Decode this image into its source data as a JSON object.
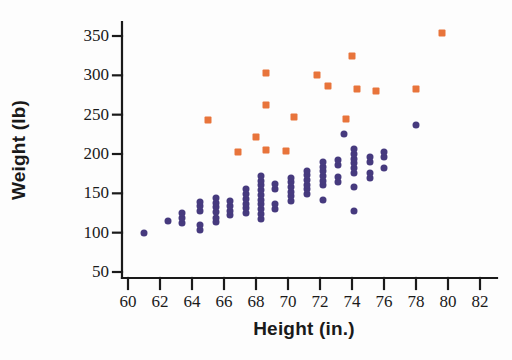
{
  "chart_data": {
    "type": "scatter",
    "title": "",
    "xlabel": "Height (in.)",
    "ylabel": "Weight (lb)",
    "xlim": [
      59,
      83
    ],
    "ylim": [
      40,
      370
    ],
    "xticks": [
      60,
      62,
      64,
      66,
      68,
      70,
      72,
      74,
      76,
      78,
      80,
      82
    ],
    "yticks": [
      50,
      100,
      150,
      200,
      250,
      300,
      350
    ],
    "xtick_labels": [
      "60",
      "62",
      "64",
      "66",
      "68",
      "70",
      "72",
      "74",
      "76",
      "78",
      "80",
      "82"
    ],
    "ytick_labels": [
      "50",
      "100",
      "150",
      "200",
      "250",
      "300",
      "350"
    ],
    "grid": false,
    "legend": "none",
    "colors": {
      "series_1": "#463a7e",
      "series_2": "#e8743b",
      "axis": "#1a1a1a",
      "background": "#ffffff"
    },
    "series": [
      {
        "name": "group-purple-circles",
        "marker": "circle",
        "color": "#463a7e",
        "points": [
          [
            61.0,
            99
          ],
          [
            62.5,
            115
          ],
          [
            63.4,
            112
          ],
          [
            63.4,
            119
          ],
          [
            63.4,
            125
          ],
          [
            64.5,
            104
          ],
          [
            64.5,
            110
          ],
          [
            64.5,
            128
          ],
          [
            64.5,
            134
          ],
          [
            64.5,
            139
          ],
          [
            65.5,
            113
          ],
          [
            65.5,
            119
          ],
          [
            65.5,
            126
          ],
          [
            65.5,
            132
          ],
          [
            65.5,
            138
          ],
          [
            65.5,
            144
          ],
          [
            66.4,
            122
          ],
          [
            66.4,
            128
          ],
          [
            66.4,
            134
          ],
          [
            66.4,
            140
          ],
          [
            67.4,
            125
          ],
          [
            67.4,
            131
          ],
          [
            67.4,
            137
          ],
          [
            67.4,
            143
          ],
          [
            67.4,
            149
          ],
          [
            67.4,
            155
          ],
          [
            68.3,
            118
          ],
          [
            68.3,
            124
          ],
          [
            68.3,
            130
          ],
          [
            68.3,
            136
          ],
          [
            68.3,
            142
          ],
          [
            68.3,
            148
          ],
          [
            68.3,
            154
          ],
          [
            68.3,
            160
          ],
          [
            68.3,
            166
          ],
          [
            68.3,
            172
          ],
          [
            69.2,
            130
          ],
          [
            69.2,
            136
          ],
          [
            69.2,
            156
          ],
          [
            69.2,
            162
          ],
          [
            70.2,
            140
          ],
          [
            70.2,
            146
          ],
          [
            70.2,
            152
          ],
          [
            70.2,
            158
          ],
          [
            70.2,
            164
          ],
          [
            70.2,
            170
          ],
          [
            71.2,
            149
          ],
          [
            71.2,
            155
          ],
          [
            71.2,
            161
          ],
          [
            71.2,
            167
          ],
          [
            71.2,
            173
          ],
          [
            71.2,
            179
          ],
          [
            72.2,
            142
          ],
          [
            72.2,
            160
          ],
          [
            72.2,
            166
          ],
          [
            72.2,
            172
          ],
          [
            72.2,
            178
          ],
          [
            72.2,
            184
          ],
          [
            72.2,
            190
          ],
          [
            73.1,
            165
          ],
          [
            73.1,
            171
          ],
          [
            73.1,
            186
          ],
          [
            73.1,
            192
          ],
          [
            74.1,
            128
          ],
          [
            74.1,
            158
          ],
          [
            74.1,
            176
          ],
          [
            74.1,
            182
          ],
          [
            74.1,
            188
          ],
          [
            74.1,
            194
          ],
          [
            74.1,
            200
          ],
          [
            74.1,
            206
          ],
          [
            75.1,
            170
          ],
          [
            75.1,
            176
          ],
          [
            75.1,
            190
          ],
          [
            75.1,
            196
          ],
          [
            76.0,
            182
          ],
          [
            76.0,
            196
          ],
          [
            76.0,
            202
          ],
          [
            73.5,
            225
          ],
          [
            78.0,
            237
          ]
        ]
      },
      {
        "name": "group-orange-squares",
        "marker": "square",
        "color": "#e8743b",
        "points": [
          [
            65.0,
            243
          ],
          [
            66.9,
            203
          ],
          [
            68.0,
            222
          ],
          [
            68.6,
            303
          ],
          [
            68.6,
            262
          ],
          [
            68.6,
            205
          ],
          [
            69.9,
            204
          ],
          [
            70.4,
            247
          ],
          [
            71.8,
            300
          ],
          [
            72.5,
            286
          ],
          [
            73.6,
            245
          ],
          [
            74.0,
            325
          ],
          [
            74.3,
            282
          ],
          [
            75.5,
            280
          ],
          [
            78.0,
            282
          ],
          [
            79.6,
            354
          ]
        ]
      }
    ]
  },
  "axes": {
    "x_title": "Height (in.)",
    "y_title": "Weight (lb)"
  }
}
